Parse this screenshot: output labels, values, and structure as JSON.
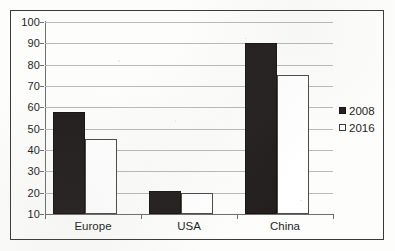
{
  "chart_data": {
    "type": "bar",
    "title": "",
    "subtitle": "",
    "xlabel": "",
    "ylabel": "",
    "categories": [
      "Europe",
      "USA",
      "China"
    ],
    "series": [
      {
        "name": "2008",
        "values": [
          58,
          21,
          90
        ],
        "color": "#231f1e",
        "marker": "filled-square"
      },
      {
        "name": "2016",
        "values": [
          45,
          20,
          75
        ],
        "color": "#ffffff",
        "marker": "hollow-square"
      }
    ],
    "ylim": [
      10,
      100
    ],
    "ytick_step": 10,
    "yticks": [
      100,
      90,
      80,
      70,
      60,
      50,
      40,
      30,
      20,
      10
    ],
    "ytick_labels": [
      "100",
      "90",
      "80",
      "70",
      "60",
      "50",
      "40",
      "30",
      "20",
      "10"
    ],
    "grid": "horizontal",
    "grid_color": "#b9b9b9",
    "legend_position": "right",
    "legend_entries": [
      "2008",
      "2016"
    ],
    "axis_color": "#6e6e6e",
    "border": true,
    "border_color": "#3a3a3a"
  },
  "legend": {
    "items": [
      {
        "label": "2008",
        "marker": "filled-square"
      },
      {
        "label": "2016",
        "marker": "hollow-square"
      }
    ]
  }
}
